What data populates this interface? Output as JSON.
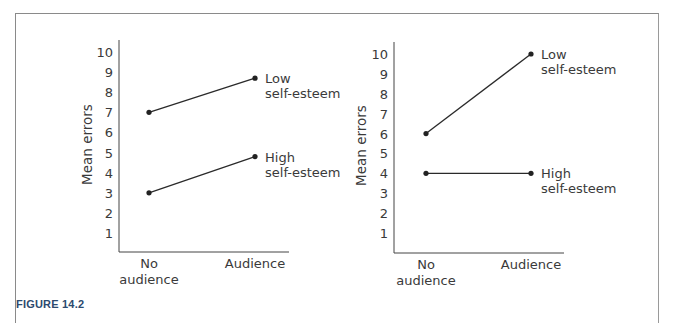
{
  "figure": {
    "caption": "FIGURE 14.2"
  },
  "chart_data": [
    {
      "type": "line",
      "title": "",
      "xlabel": "",
      "ylabel": "Mean errors",
      "categories": [
        "No audience",
        "Audience"
      ],
      "category_labels": [
        [
          "No",
          "audience"
        ],
        [
          "Audience"
        ]
      ],
      "yticks": [
        1,
        2,
        3,
        4,
        5,
        6,
        7,
        8,
        9,
        10
      ],
      "ylim": [
        0,
        10
      ],
      "grid": false,
      "legend": "inline labels at right end of lines",
      "series": [
        {
          "name": "Low self-esteem",
          "label_lines": [
            "Low",
            "self-esteem"
          ],
          "values": [
            7,
            8.7
          ]
        },
        {
          "name": "High self-esteem",
          "label_lines": [
            "High",
            "self-esteem"
          ],
          "values": [
            3,
            4.8
          ]
        }
      ]
    },
    {
      "type": "line",
      "title": "",
      "xlabel": "",
      "ylabel": "Mean errors",
      "categories": [
        "No audience",
        "Audience"
      ],
      "category_labels": [
        [
          "No",
          "audience"
        ],
        [
          "Audience"
        ]
      ],
      "yticks": [
        1,
        2,
        3,
        4,
        5,
        6,
        7,
        8,
        9,
        10
      ],
      "ylim": [
        0,
        10
      ],
      "grid": false,
      "legend": "inline labels at right end of lines",
      "series": [
        {
          "name": "Low self-esteem",
          "label_lines": [
            "Low",
            "self-esteem"
          ],
          "values": [
            6,
            10
          ]
        },
        {
          "name": "High self-esteem",
          "label_lines": [
            "High",
            "self-esteem"
          ],
          "values": [
            4,
            4
          ]
        }
      ]
    }
  ]
}
